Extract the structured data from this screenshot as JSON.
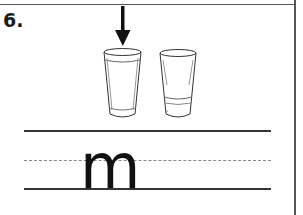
{
  "worksheet": {
    "item_number": "6.",
    "illustration": {
      "arrow": "down-arrow-icon",
      "glasses": [
        {
          "state": "full",
          "selected": true
        },
        {
          "state": "low",
          "selected": false
        }
      ]
    },
    "handwriting": {
      "letter": "m",
      "guide_lines": [
        "top-line",
        "dashed-midline",
        "baseline"
      ]
    }
  }
}
